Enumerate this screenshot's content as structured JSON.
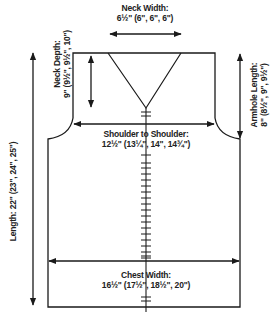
{
  "diagram": {
    "type": "knitting-schematic",
    "colors": {
      "line": "#1a1a1a",
      "background": "#ffffff"
    },
    "measurements": {
      "neck_width": {
        "label": "Neck Width:",
        "value": "6½\" (6\", 6\", 6\")"
      },
      "neck_depth": {
        "label": "Neck Depth:",
        "value": "9\" (9½\", 9½\", 10\")"
      },
      "armhole_length": {
        "label": "Armhole Length:",
        "value": "8\" (8½\", 9\", 9½\")"
      },
      "shoulder_to_shoulder": {
        "label": "Shoulder to Shoulder:",
        "value": "12½\" (13¼\", 14\", 14¾\")"
      },
      "length": {
        "label": "Length:",
        "value": "22\" (23\", 24\", 25\")"
      },
      "chest_width": {
        "label": "Chest Width:",
        "value": "16½\" (17½\", 18½\", 20\")"
      }
    }
  }
}
